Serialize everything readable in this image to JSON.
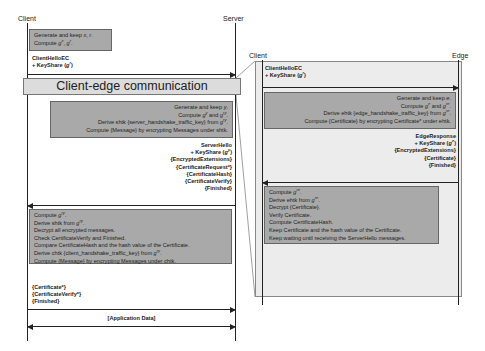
{
  "diagram": {
    "type": "sequence-diagram",
    "main": {
      "participants": {
        "client": "Client",
        "server": "Server"
      },
      "client_init_box": [
        "Generate and keep x, r.",
        "Compute g^x, g^r."
      ],
      "client_hello": [
        "ClientHelloEC",
        "+ KeyShare (g^r)"
      ],
      "banner": "Client-edge communication",
      "server_box": [
        "Generate and keep y.",
        "Compute g^y and g^ry.",
        "Derive shtk {server_handshake_traffic_key} from g^ry.",
        "Compute {Message} by encrypting Messages under shtk."
      ],
      "server_hello": [
        "ServerHello",
        "+ KeyShare (g^y)",
        "{EncryptedExtensions}",
        "{CertificateRequest*}",
        "{CertificateHash}",
        "{CertificateVerify}",
        "{Finished}"
      ],
      "client_process_box": [
        "Compute g^ry.",
        "Derive shtk from g^ry.",
        "Decrypt all encrypted messages.",
        "Check CertificateVerify and Finished.",
        "Compare CertificateHash and the hash value of the Certificate.",
        "Derive chtk {client_handshake_traffic_key} from g^ry.",
        "Compute {Message} by encrypting Messages under chtk."
      ],
      "client_final": [
        "{Certificate*}",
        "{CertificateVerify*}",
        "{Finished}"
      ],
      "app_data": "[Application Data]"
    },
    "inset": {
      "participants": {
        "client": "Client",
        "edge": "Edge"
      },
      "client_hello": [
        "ClientHelloEC",
        "+ KeyShare (g^r)"
      ],
      "edge_box": [
        "Generate and keep e.",
        "Compute g^e and g^re.",
        "Derive ehtk {edge_handshake_traffic_key} from g^re.",
        "Compute {Certificate} by encrypting Certificate* under ehtk."
      ],
      "edge_response": [
        "EdgeResponse",
        "+ KeyShare (g^e)",
        "{EncryptedExtensions}",
        "{Certificate}",
        "{Finished}"
      ],
      "client_box": [
        "Compute g^re.",
        "Derive ehtk from g^re.",
        "Decrypt {Certificate}.",
        "Verify Certificate.",
        "Compute CertificateHash.",
        "Keep Certificate and the hash value of the Certificate.",
        "Keep waiting until receiving the ServerHello messages."
      ]
    },
    "colors": {
      "process_box": "#a9a9a9",
      "banner": "#dcdcdc",
      "inset_bg": "#ececec",
      "line": "#222222"
    }
  }
}
